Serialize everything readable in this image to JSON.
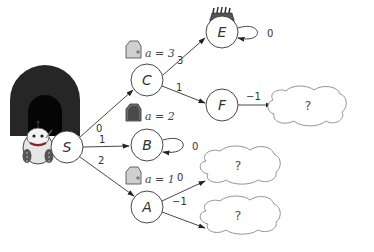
{
  "diagram": {
    "type": "state-transition-graph",
    "nodes": [
      {
        "id": "S",
        "label": "S",
        "x": 67,
        "y": 147
      },
      {
        "id": "C",
        "label": "C",
        "x": 147,
        "y": 80
      },
      {
        "id": "B",
        "label": "B",
        "x": 147,
        "y": 145
      },
      {
        "id": "A",
        "label": "A",
        "x": 147,
        "y": 207
      },
      {
        "id": "E",
        "label": "E",
        "x": 222,
        "y": 32
      },
      {
        "id": "F",
        "label": "F",
        "x": 222,
        "y": 105
      }
    ],
    "edges": [
      {
        "from": "S",
        "to": "C",
        "label": "0"
      },
      {
        "from": "S",
        "to": "B",
        "label": "1"
      },
      {
        "from": "S",
        "to": "A",
        "label": "2"
      },
      {
        "from": "C",
        "to": "E",
        "label": "3"
      },
      {
        "from": "C",
        "to": "F",
        "label": "1"
      },
      {
        "from": "E",
        "to": "E",
        "label": "0"
      },
      {
        "from": "B",
        "to": "B",
        "label": "0"
      },
      {
        "from": "F",
        "to": "cloud1",
        "label": "−1"
      },
      {
        "from": "A",
        "to": "cloud2",
        "label": "0"
      },
      {
        "from": "A",
        "to": "cloud3",
        "label": "−1"
      }
    ],
    "doors": [
      {
        "node": "C",
        "label": "a = 3",
        "shade": "light"
      },
      {
        "node": "B",
        "label": "a = 2",
        "shade": "dark"
      },
      {
        "node": "A",
        "label": "a = 1",
        "shade": "light"
      }
    ],
    "clouds": [
      {
        "id": "cloud1",
        "label": "?"
      },
      {
        "id": "cloud2",
        "label": "?"
      },
      {
        "id": "cloud3",
        "label": "?"
      }
    ],
    "icons": {
      "tunnel": "tunnel-entrance",
      "robot": "robot-character",
      "treasure": "treasure-chest"
    }
  }
}
